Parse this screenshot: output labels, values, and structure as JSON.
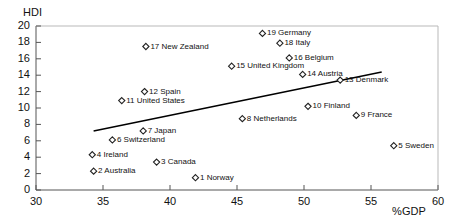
{
  "chart_data": {
    "type": "scatter",
    "title": "",
    "xlabel": "%GDP",
    "ylabel": "HDI",
    "xlim": [
      30,
      60
    ],
    "ylim": [
      0,
      20
    ],
    "xticks": [
      30,
      35,
      40,
      45,
      50,
      55,
      60
    ],
    "yticks": [
      0,
      2,
      4,
      6,
      8,
      10,
      12,
      14,
      16,
      18,
      20
    ],
    "grid": false,
    "legend": "none",
    "marker": "open-diamond",
    "points": [
      {
        "rank": 1,
        "label": "1 Norway",
        "x": 41.9,
        "y": 1.5
      },
      {
        "rank": 2,
        "label": "2 Australia",
        "x": 34.3,
        "y": 2.3
      },
      {
        "rank": 3,
        "label": "3 Canada",
        "x": 39.0,
        "y": 3.4
      },
      {
        "rank": 4,
        "label": "4 Ireland",
        "x": 34.2,
        "y": 4.3
      },
      {
        "rank": 5,
        "label": "5 Sweden",
        "x": 56.7,
        "y": 5.4
      },
      {
        "rank": 6,
        "label": "6 Switzerland",
        "x": 35.7,
        "y": 6.1
      },
      {
        "rank": 7,
        "label": "7 Japan",
        "x": 38.0,
        "y": 7.2
      },
      {
        "rank": 8,
        "label": "8 Netherlands",
        "x": 45.4,
        "y": 8.7
      },
      {
        "rank": 9,
        "label": "9 France",
        "x": 53.9,
        "y": 9.1
      },
      {
        "rank": 10,
        "label": "10 Finland",
        "x": 50.3,
        "y": 10.2
      },
      {
        "rank": 11,
        "label": "11 United States",
        "x": 36.4,
        "y": 10.9
      },
      {
        "rank": 12,
        "label": "12 Spain",
        "x": 38.1,
        "y": 12.0
      },
      {
        "rank": 13,
        "label": "13 Denmark",
        "x": 52.7,
        "y": 13.4
      },
      {
        "rank": 14,
        "label": "14 Austria",
        "x": 49.9,
        "y": 14.1
      },
      {
        "rank": 15,
        "label": "15 United Kingdom",
        "x": 44.6,
        "y": 15.1
      },
      {
        "rank": 16,
        "label": "16 Belgium",
        "x": 48.9,
        "y": 16.1
      },
      {
        "rank": 17,
        "label": "17 New Zealand",
        "x": 38.2,
        "y": 17.5
      },
      {
        "rank": 18,
        "label": "18 Italy",
        "x": 48.2,
        "y": 17.9
      },
      {
        "rank": 19,
        "label": "19 Germany",
        "x": 46.9,
        "y": 19.1
      }
    ],
    "trendline": {
      "x_start": 34.3,
      "y_start": 7.2,
      "x_end": 55.8,
      "y_end": 14.4
    }
  },
  "colors": {
    "axis": "#555555",
    "text": "#111111",
    "marker_stroke": "#222222",
    "trendline": "#000000",
    "background": "#ffffff"
  }
}
